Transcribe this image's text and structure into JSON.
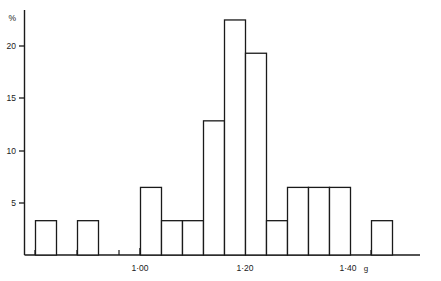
{
  "chart_data": {
    "type": "bar",
    "title": "",
    "subtitle": "",
    "xlabel": "g",
    "ylabel": "%",
    "ylim": [
      0,
      24
    ],
    "xlim": [
      0.86,
      1.6
    ],
    "grid": false,
    "legend": null,
    "bin_width": 0.04,
    "bin_starts": [
      0.88,
      0.92,
      0.96,
      1.0,
      1.04,
      1.08,
      1.12,
      1.16,
      1.2,
      1.24,
      1.28,
      1.32,
      1.36,
      1.4,
      1.44
    ],
    "categories": [
      "0.88",
      "0.92",
      "0.96",
      "1.00",
      "1.04",
      "1.08",
      "1.12",
      "1.16",
      "1.20",
      "1.24",
      "1.28",
      "1.32",
      "1.36",
      "1.40",
      "1.44"
    ],
    "values": [
      3.3,
      0,
      3.3,
      0,
      0,
      6.5,
      3.3,
      3.3,
      12.9,
      22.6,
      19.4,
      3.3,
      6.5,
      6.5,
      6.5
    ],
    "trailing_gap_bins": 1,
    "final_bar": {
      "start": 1.48,
      "value": 3.3
    },
    "y_ticks": [
      5,
      10,
      15,
      20
    ],
    "y_tick_labels": [
      "5",
      "10",
      "15",
      "20"
    ],
    "x_major_ticks": [
      1.0,
      1.2,
      1.4
    ],
    "x_major_tick_labels": [
      "1·00",
      "1·20",
      "1·40"
    ],
    "x_minor_tick_count": 19,
    "axis_color": "#1a1a1a",
    "bar_fill": "#ffffff",
    "bar_stroke": "#1a1a1a"
  },
  "axes": {
    "y_unit_label": "%",
    "x_unit_label": "g"
  },
  "y_tick_items": [
    {
      "label": "20",
      "y": 46
    },
    {
      "label": "15",
      "y": 98
    },
    {
      "label": "10",
      "y": 151
    },
    {
      "label": "5",
      "y": 203
    }
  ],
  "x_tick_items": [
    {
      "label": "1·00",
      "x": 140
    },
    {
      "label": "1·20",
      "x": 245
    },
    {
      "label": "1·40",
      "x": 350
    }
  ]
}
